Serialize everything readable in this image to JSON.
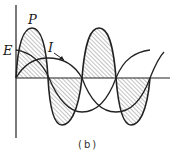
{
  "diagram": {
    "caption": "(b)",
    "labels": {
      "power": "P",
      "voltage": "E",
      "current": "I"
    },
    "axes": {
      "vertical": {
        "x": 16,
        "y_top": 5,
        "y_bottom": 138
      },
      "horizontal": {
        "y": 78,
        "x_left": 16,
        "x_right": 170
      }
    },
    "curves": [
      {
        "name": "P",
        "description": "power waveform, double frequency, hatched lobes above and below axis"
      },
      {
        "name": "E",
        "description": "voltage waveform, cosine starting at maximum"
      },
      {
        "name": "I",
        "description": "current waveform, lagging voltage"
      }
    ],
    "colors": {
      "line": "#222222",
      "hatch": "#555555",
      "background": "#ffffff"
    }
  }
}
